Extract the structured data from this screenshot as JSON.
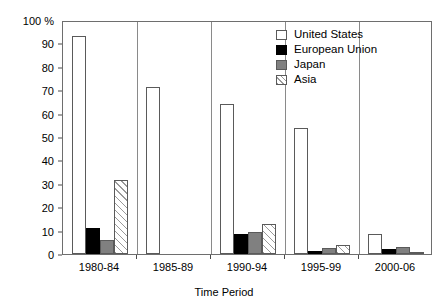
{
  "chart_data": {
    "type": "bar",
    "title": "",
    "subtitle": "",
    "xlabel": "Time Period",
    "ylabel": "",
    "y_axis_top_label": "100 %",
    "categories": [
      "1980-84",
      "1985-89",
      "1990-94",
      "1995-99",
      "2000-06"
    ],
    "series": [
      {
        "name": "United States",
        "key": "us",
        "color": "#ffffff",
        "pattern": "solid",
        "values": [
          93,
          71.5,
          64,
          54,
          8.5
        ]
      },
      {
        "name": "European Union",
        "key": "eu",
        "color": "#000000",
        "pattern": "solid",
        "values": [
          11,
          0,
          8.5,
          1.5,
          2
        ]
      },
      {
        "name": "Japan",
        "key": "jp",
        "color": "#808080",
        "pattern": "solid",
        "values": [
          6,
          0,
          9.5,
          2.5,
          3
        ]
      },
      {
        "name": "Asia",
        "key": "as",
        "color": "#ffffff",
        "pattern": "hatch",
        "values": [
          31.5,
          0,
          13,
          4,
          1
        ]
      }
    ],
    "ylim": [
      0,
      100
    ],
    "yticks": [
      0,
      10,
      20,
      30,
      40,
      50,
      60,
      70,
      80,
      90,
      100
    ],
    "ytick_labels": [
      "0",
      "10",
      "20",
      "30",
      "40",
      "50",
      "60",
      "70",
      "80",
      "90",
      "100 %"
    ],
    "grid": false,
    "legend_position": "top-right"
  }
}
